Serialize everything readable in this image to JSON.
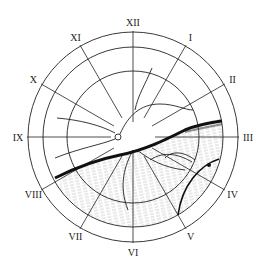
{
  "figure": {
    "type": "retinal fundus clock-hour chart",
    "clock_labels": [
      "XII",
      "I",
      "II",
      "III",
      "IV",
      "V",
      "VI",
      "VII",
      "VIII",
      "IX",
      "X",
      "XI"
    ],
    "colors": {
      "line": "#222222",
      "shade": "#9a9a9a",
      "background": "#ffffff"
    }
  }
}
